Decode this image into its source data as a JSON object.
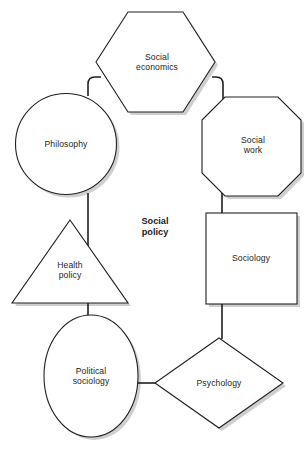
{
  "diagram": {
    "center": {
      "label": "Social\npolicy",
      "x": 155,
      "y": 227
    },
    "nodes": [
      {
        "id": "social-economics",
        "label": "Social\neconomics",
        "shape": "hexagon",
        "cx": 157,
        "cy": 62,
        "w": 116,
        "h": 100
      },
      {
        "id": "philosophy",
        "label": "Philosophy",
        "shape": "circle",
        "cx": 66,
        "cy": 144,
        "w": 101,
        "h": 101
      },
      {
        "id": "social-work",
        "label": "Social\nwork",
        "shape": "octagon",
        "cx": 253,
        "cy": 145,
        "w": 95,
        "h": 95
      },
      {
        "id": "health-policy",
        "label": "Health\npolicy",
        "shape": "triangle",
        "cx": 70,
        "cy": 270,
        "w": 112,
        "h": 99
      },
      {
        "id": "sociology",
        "label": "Sociology",
        "shape": "square",
        "cx": 251,
        "cy": 258,
        "w": 91,
        "h": 91
      },
      {
        "id": "political-sociology",
        "label": "Political\nsociology",
        "shape": "ellipse",
        "cx": 91,
        "cy": 376,
        "w": 94,
        "h": 122
      },
      {
        "id": "psychology",
        "label": "Psychology",
        "shape": "diamond",
        "cx": 219,
        "cy": 383,
        "w": 128,
        "h": 90
      }
    ],
    "connectors": [
      {
        "id": "philosophy-to-social-economics",
        "from": "philosophy",
        "to": "social-economics"
      },
      {
        "id": "social-economics-to-social-work",
        "from": "social-economics",
        "to": "social-work"
      },
      {
        "id": "philosophy-to-political-sociology",
        "from": "philosophy",
        "to": "political-sociology"
      },
      {
        "id": "social-work-to-sociology",
        "from": "social-work",
        "to": "sociology"
      },
      {
        "id": "sociology-to-psychology",
        "from": "sociology",
        "to": "psychology"
      },
      {
        "id": "political-sociology-to-psychology",
        "from": "political-sociology",
        "to": "psychology"
      }
    ],
    "colors": {
      "stroke": "#231f20",
      "fill": "#ffffff",
      "shadow": "#bdbdbd",
      "text": "#231f20",
      "center_text": "#1a1a1a",
      "background": "#ffffff"
    }
  }
}
